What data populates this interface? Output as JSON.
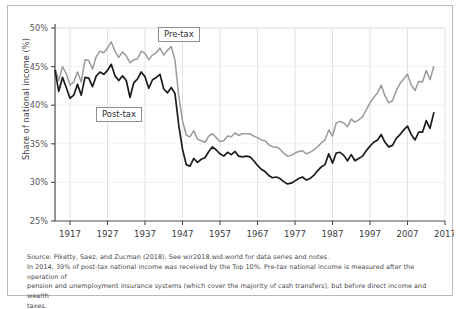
{
  "chart_data": {
    "type": "line",
    "title": "",
    "xlabel": "",
    "ylabel": "Share of national income (%)",
    "xlim": [
      1913,
      2017
    ],
    "ylim": [
      25,
      50
    ],
    "ytick_labels": [
      "25%",
      "30%",
      "35%",
      "40%",
      "45%",
      "50%"
    ],
    "yticks": [
      25,
      30,
      35,
      40,
      45,
      50
    ],
    "xtick_labels": [
      "1917",
      "1927",
      "1937",
      "1947",
      "1957",
      "1967",
      "1977",
      "1987",
      "1997",
      "2007",
      "2017"
    ],
    "xticks": [
      1917,
      1927,
      1937,
      1947,
      1957,
      1967,
      1977,
      1987,
      1997,
      2007,
      2017
    ],
    "grid": "both-light",
    "legend_position": "inline-callouts",
    "annotations": [
      {
        "name": "Pre-tax",
        "x": 1941,
        "y": 48.4
      },
      {
        "name": "Post-tax",
        "x": 1932,
        "y": 38.6
      }
    ],
    "series": [
      {
        "name": "Pre-tax",
        "color": "#9a9a9e",
        "x": [
          1913,
          1914,
          1915,
          1916,
          1917,
          1918,
          1919,
          1920,
          1921,
          1922,
          1923,
          1924,
          1925,
          1926,
          1927,
          1928,
          1929,
          1930,
          1931,
          1932,
          1933,
          1934,
          1935,
          1936,
          1937,
          1938,
          1939,
          1940,
          1941,
          1942,
          1943,
          1944,
          1945,
          1946,
          1947,
          1948,
          1949,
          1950,
          1951,
          1952,
          1953,
          1954,
          1955,
          1956,
          1957,
          1958,
          1959,
          1960,
          1961,
          1962,
          1963,
          1964,
          1965,
          1966,
          1967,
          1968,
          1969,
          1970,
          1971,
          1972,
          1973,
          1974,
          1975,
          1976,
          1977,
          1978,
          1979,
          1980,
          1981,
          1982,
          1983,
          1984,
          1985,
          1986,
          1987,
          1988,
          1989,
          1990,
          1991,
          1992,
          1993,
          1994,
          1995,
          1996,
          1997,
          1998,
          1999,
          2000,
          2001,
          2002,
          2003,
          2004,
          2005,
          2006,
          2007,
          2008,
          2009,
          2010,
          2011,
          2012,
          2013,
          2014
        ],
        "y": [
          44.8,
          43.2,
          45.0,
          44.1,
          42.6,
          43.0,
          44.3,
          43.0,
          45.9,
          45.8,
          44.7,
          46.3,
          47.0,
          46.8,
          47.4,
          48.2,
          47.0,
          46.2,
          46.9,
          46.4,
          45.5,
          45.9,
          46.0,
          47.0,
          46.7,
          45.9,
          46.5,
          46.8,
          47.4,
          46.5,
          47.1,
          47.6,
          45.8,
          41.2,
          38.0,
          36.1,
          35.9,
          36.7,
          35.6,
          35.4,
          35.2,
          36.0,
          36.3,
          35.8,
          35.3,
          35.4,
          36.0,
          35.9,
          36.4,
          36.1,
          36.3,
          36.3,
          36.3,
          36.0,
          35.8,
          35.5,
          35.4,
          34.9,
          34.6,
          34.6,
          34.3,
          33.8,
          33.4,
          33.5,
          33.8,
          34.0,
          34.1,
          33.7,
          33.9,
          34.2,
          34.6,
          35.1,
          35.5,
          36.8,
          36.0,
          37.7,
          37.9,
          37.7,
          37.2,
          38.2,
          37.8,
          38.1,
          38.5,
          39.4,
          40.3,
          41.0,
          41.6,
          42.6,
          41.2,
          40.3,
          40.6,
          41.9,
          42.8,
          43.4,
          44.0,
          42.6,
          41.9,
          43.1,
          43.0,
          44.5,
          43.3,
          45.0
        ],
        "final_value": 45.0
      },
      {
        "name": "Post-tax",
        "color": "#1c1c1e",
        "x": [
          1913,
          1914,
          1915,
          1916,
          1917,
          1918,
          1919,
          1920,
          1921,
          1922,
          1923,
          1924,
          1925,
          1926,
          1927,
          1928,
          1929,
          1930,
          1931,
          1932,
          1933,
          1934,
          1935,
          1936,
          1937,
          1938,
          1939,
          1940,
          1941,
          1942,
          1943,
          1944,
          1945,
          1946,
          1947,
          1948,
          1949,
          1950,
          1951,
          1952,
          1953,
          1954,
          1955,
          1956,
          1957,
          1958,
          1959,
          1960,
          1961,
          1962,
          1963,
          1964,
          1965,
          1966,
          1967,
          1968,
          1969,
          1970,
          1971,
          1972,
          1973,
          1974,
          1975,
          1976,
          1977,
          1978,
          1979,
          1980,
          1981,
          1982,
          1983,
          1984,
          1985,
          1986,
          1987,
          1988,
          1989,
          1990,
          1991,
          1992,
          1993,
          1994,
          1995,
          1996,
          1997,
          1998,
          1999,
          2000,
          2001,
          2002,
          2003,
          2004,
          2005,
          2006,
          2007,
          2008,
          2009,
          2010,
          2011,
          2012,
          2013,
          2014
        ],
        "y": [
          44.5,
          41.8,
          43.6,
          42.3,
          40.9,
          41.3,
          42.7,
          41.3,
          43.6,
          43.5,
          42.4,
          43.8,
          44.3,
          44.0,
          44.5,
          45.3,
          43.8,
          43.2,
          43.8,
          43.2,
          41.0,
          42.9,
          43.4,
          44.3,
          43.7,
          42.2,
          43.3,
          43.6,
          44.0,
          42.1,
          41.6,
          42.3,
          41.5,
          37.4,
          34.3,
          32.3,
          32.1,
          33.1,
          32.6,
          33.0,
          33.2,
          34.0,
          34.6,
          34.2,
          33.7,
          33.4,
          33.9,
          33.6,
          34.0,
          33.4,
          33.3,
          33.4,
          33.3,
          32.8,
          32.2,
          31.7,
          31.4,
          30.9,
          30.6,
          30.7,
          30.5,
          30.1,
          29.8,
          29.9,
          30.2,
          30.5,
          30.7,
          30.3,
          30.5,
          30.9,
          31.5,
          32.0,
          32.3,
          33.7,
          32.5,
          33.8,
          33.9,
          33.5,
          32.8,
          33.6,
          32.8,
          33.1,
          33.4,
          34.1,
          34.7,
          35.2,
          35.5,
          36.2,
          35.2,
          34.6,
          34.8,
          35.7,
          36.2,
          36.8,
          37.3,
          36.2,
          35.5,
          36.5,
          36.5,
          38.0,
          37.0,
          39.0
        ],
        "final_value": 39.0
      }
    ]
  },
  "callouts": {
    "pretax": "Pre-tax",
    "posttax": "Post-tax"
  },
  "notes": {
    "line1": "Source: Piketty, Saez, and Zucman (2018). See wir2018.wid.world for data series and notes.",
    "line2": "In 2014, 39% of post-tax national income was received by the Top 10%. Pre-tax national income is measured after the operation of",
    "line3": "pension and unemployment insurance systems (which cover the majority of cash transfers), but before direct income and wealth",
    "line4": "taxes."
  }
}
